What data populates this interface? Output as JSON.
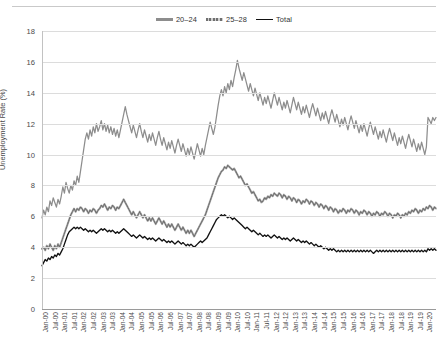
{
  "chart_data": {
    "type": "line",
    "title": "",
    "xlabel": "",
    "ylabel": "Unemployment Rate (%)",
    "ylim": [
      0,
      18
    ],
    "ytick_step": 2,
    "yticks": [
      0,
      2,
      4,
      6,
      8,
      10,
      12,
      14,
      16,
      18
    ],
    "grid": true,
    "legend_position": "top-center",
    "x_start": "Jan-00",
    "x_end": "Jan-20",
    "x_tick_interval_months": 6,
    "tick_labels": [
      "Jan-00",
      "Jul-00",
      "Jan-01",
      "Jul-01",
      "Jan-02",
      "Jul-02",
      "Jan-03",
      "Jul-03",
      "Jan-04",
      "Jul-04",
      "Jan-05",
      "Jul-05",
      "Jan-06",
      "Jul-06",
      "Jan-07",
      "Jul-07",
      "Jan-08",
      "Jul-08",
      "Jan-09",
      "Jul-09",
      "Jan-10",
      "Jul-10",
      "Jan-11",
      "Jul-11",
      "Jan-12",
      "Jul-12",
      "Jan-13",
      "Jul-13",
      "Jan-14",
      "Jul-14",
      "Jan-15",
      "Jul-15",
      "Jan-16",
      "Jul-16",
      "Jan-17",
      "Jul-17",
      "Jan-18",
      "Jul-18",
      "Jan-19",
      "Jul-19",
      "Jan-20"
    ],
    "series": [
      {
        "name": "20–24",
        "color": "#8d8d8d",
        "style": "solid-gray",
        "values": [
          5.9,
          6.4,
          6.1,
          6.6,
          6.3,
          7.0,
          6.7,
          7.2,
          6.9,
          6.6,
          7.1,
          6.8,
          7.3,
          7.9,
          7.5,
          8.2,
          7.8,
          7.5,
          8.0,
          7.7,
          8.3,
          8.0,
          8.6,
          8.2,
          8.9,
          9.6,
          10.3,
          11.0,
          11.4,
          11.0,
          11.6,
          11.2,
          11.8,
          11.4,
          12.0,
          11.5,
          11.8,
          12.2,
          11.6,
          12.0,
          11.5,
          11.9,
          11.4,
          11.8,
          11.3,
          11.7,
          11.2,
          11.6,
          11.1,
          11.6,
          12.1,
          12.6,
          13.1,
          12.6,
          12.2,
          11.8,
          11.4,
          11.9,
          11.5,
          11.1,
          11.6,
          12.0,
          11.5,
          11.1,
          11.6,
          11.2,
          10.8,
          11.3,
          10.9,
          11.4,
          11.0,
          10.6,
          11.1,
          11.5,
          11.0,
          10.6,
          11.1,
          10.7,
          10.3,
          10.8,
          10.4,
          10.9,
          10.5,
          10.1,
          10.6,
          11.0,
          10.6,
          10.2,
          10.7,
          10.3,
          9.9,
          10.4,
          10.0,
          10.5,
          10.1,
          9.7,
          10.2,
          10.7,
          10.3,
          9.9,
          10.4,
          10.0,
          10.6,
          11.1,
          11.6,
          12.1,
          11.7,
          11.3,
          11.8,
          12.5,
          13.2,
          13.8,
          14.2,
          13.8,
          14.4,
          14.0,
          14.6,
          14.2,
          14.8,
          14.4,
          15.0,
          15.5,
          16.1,
          15.6,
          15.2,
          14.8,
          15.3,
          14.9,
          14.5,
          14.1,
          14.6,
          14.2,
          13.8,
          14.3,
          13.9,
          13.5,
          14.0,
          13.6,
          13.2,
          13.7,
          13.3,
          13.8,
          13.4,
          13.0,
          13.5,
          14.0,
          13.6,
          13.2,
          13.7,
          13.3,
          12.9,
          13.4,
          13.0,
          13.5,
          13.1,
          12.7,
          13.2,
          13.7,
          13.3,
          12.9,
          13.4,
          13.0,
          12.6,
          13.1,
          12.7,
          13.2,
          12.8,
          12.4,
          12.9,
          13.3,
          12.9,
          12.5,
          13.0,
          12.6,
          12.2,
          12.7,
          12.3,
          12.8,
          12.4,
          12.0,
          12.5,
          12.9,
          12.5,
          12.1,
          12.6,
          12.2,
          11.8,
          12.3,
          11.9,
          12.4,
          12.0,
          11.6,
          12.1,
          12.5,
          12.1,
          11.7,
          12.2,
          11.8,
          11.4,
          11.9,
          11.5,
          12.0,
          11.6,
          11.2,
          11.7,
          12.1,
          11.7,
          11.3,
          11.8,
          11.4,
          11.0,
          11.5,
          11.1,
          11.6,
          11.2,
          10.8,
          11.3,
          11.7,
          11.3,
          10.9,
          11.4,
          11.0,
          10.6,
          11.1,
          10.7,
          11.2,
          10.8,
          10.4,
          10.9,
          11.3,
          10.9,
          10.5,
          11.0,
          10.6,
          10.2,
          10.7,
          10.3,
          10.8,
          10.4,
          10.0,
          10.5,
          12.4,
          12.2,
          12.0,
          12.4,
          12.2,
          12.4
        ],
        "start_value": 5.9,
        "peak_value": 16.1,
        "peak_label": "Jul-09",
        "end_value": 12.4
      },
      {
        "name": "25–28",
        "color": "#6e6e6e",
        "style": "dashed-gray",
        "values": [
          3.9,
          4.0,
          3.8,
          4.1,
          3.9,
          4.2,
          4.0,
          3.8,
          4.1,
          3.9,
          4.2,
          4.0,
          4.3,
          4.6,
          4.9,
          5.2,
          5.5,
          5.8,
          6.1,
          6.3,
          6.5,
          6.3,
          6.5,
          6.4,
          6.6,
          6.5,
          6.3,
          6.5,
          6.4,
          6.2,
          6.4,
          6.3,
          6.5,
          6.4,
          6.2,
          6.4,
          6.5,
          6.7,
          6.6,
          6.8,
          6.6,
          6.4,
          6.6,
          6.5,
          6.7,
          6.6,
          6.4,
          6.6,
          6.5,
          6.7,
          6.9,
          7.1,
          6.9,
          6.7,
          6.5,
          6.3,
          6.1,
          6.3,
          6.1,
          5.9,
          6.1,
          6.3,
          6.1,
          5.9,
          6.1,
          5.9,
          5.7,
          5.9,
          5.7,
          5.9,
          5.7,
          5.5,
          5.7,
          5.9,
          5.7,
          5.5,
          5.7,
          5.5,
          5.3,
          5.5,
          5.3,
          5.5,
          5.3,
          5.1,
          5.3,
          5.5,
          5.3,
          5.1,
          5.3,
          5.1,
          4.9,
          5.1,
          4.9,
          5.1,
          4.9,
          4.7,
          4.9,
          5.1,
          5.3,
          5.5,
          5.7,
          5.9,
          6.1,
          6.4,
          6.7,
          7.0,
          7.3,
          7.6,
          7.9,
          8.2,
          8.5,
          8.7,
          8.9,
          9.0,
          9.2,
          9.1,
          9.3,
          9.2,
          9.1,
          9.0,
          9.1,
          8.9,
          8.7,
          8.5,
          8.6,
          8.4,
          8.2,
          8.0,
          8.1,
          7.9,
          7.7,
          7.5,
          7.6,
          7.4,
          7.2,
          7.0,
          7.1,
          6.9,
          7.0,
          7.2,
          7.1,
          7.3,
          7.2,
          7.4,
          7.3,
          7.5,
          7.4,
          7.3,
          7.5,
          7.4,
          7.2,
          7.4,
          7.3,
          7.1,
          7.3,
          7.2,
          7.0,
          7.2,
          7.1,
          6.9,
          7.1,
          7.0,
          6.8,
          7.0,
          6.9,
          7.1,
          7.0,
          6.8,
          7.0,
          6.9,
          6.7,
          6.9,
          6.8,
          6.6,
          6.8,
          6.7,
          6.5,
          6.7,
          6.6,
          6.4,
          6.6,
          6.5,
          6.3,
          6.5,
          6.4,
          6.2,
          6.4,
          6.3,
          6.5,
          6.4,
          6.2,
          6.4,
          6.3,
          6.5,
          6.4,
          6.2,
          6.4,
          6.3,
          6.1,
          6.3,
          6.2,
          6.4,
          6.3,
          6.1,
          6.3,
          6.2,
          6.0,
          6.2,
          6.1,
          6.3,
          6.2,
          6.0,
          6.2,
          6.1,
          6.3,
          6.2,
          6.0,
          6.2,
          6.1,
          5.9,
          6.1,
          6.0,
          6.2,
          6.1,
          5.9,
          6.1,
          6.0,
          6.2,
          6.1,
          6.3,
          6.2,
          6.4,
          6.3,
          6.5,
          6.4,
          6.2,
          6.4,
          6.3,
          6.5,
          6.4,
          6.6,
          6.5,
          6.7,
          6.6,
          6.4,
          6.6,
          6.5
        ],
        "start_value": 3.9,
        "peak_value": 9.3,
        "peak_label": "Jan-10",
        "end_value": 6.5
      },
      {
        "name": "Total",
        "color": "#111111",
        "style": "solid-black",
        "values": [
          2.8,
          3.0,
          3.2,
          3.1,
          3.3,
          3.2,
          3.4,
          3.3,
          3.5,
          3.4,
          3.6,
          3.5,
          3.7,
          3.9,
          4.2,
          4.5,
          4.8,
          5.0,
          5.1,
          5.2,
          5.3,
          5.2,
          5.3,
          5.2,
          5.3,
          5.2,
          5.1,
          5.2,
          5.1,
          5.0,
          5.1,
          5.0,
          5.1,
          5.0,
          4.9,
          5.0,
          5.1,
          5.2,
          5.1,
          5.2,
          5.1,
          5.0,
          5.1,
          5.0,
          5.1,
          5.0,
          4.9,
          5.0,
          4.9,
          5.0,
          5.1,
          5.2,
          5.1,
          5.0,
          4.9,
          4.8,
          4.7,
          4.8,
          4.7,
          4.6,
          4.7,
          4.8,
          4.7,
          4.6,
          4.7,
          4.6,
          4.5,
          4.6,
          4.5,
          4.6,
          4.5,
          4.4,
          4.5,
          4.6,
          4.5,
          4.4,
          4.5,
          4.4,
          4.3,
          4.4,
          4.3,
          4.4,
          4.3,
          4.2,
          4.3,
          4.4,
          4.3,
          4.2,
          4.3,
          4.2,
          4.1,
          4.2,
          4.1,
          4.2,
          4.1,
          4.0,
          4.1,
          4.2,
          4.3,
          4.4,
          4.3,
          4.4,
          4.5,
          4.6,
          4.8,
          5.0,
          5.2,
          5.4,
          5.6,
          5.8,
          5.9,
          6.0,
          6.1,
          6.0,
          6.1,
          6.0,
          5.9,
          6.0,
          5.9,
          5.8,
          5.9,
          5.8,
          5.7,
          5.6,
          5.5,
          5.4,
          5.3,
          5.2,
          5.3,
          5.2,
          5.1,
          5.0,
          5.1,
          5.0,
          4.9,
          4.8,
          4.9,
          4.8,
          4.7,
          4.8,
          4.7,
          4.8,
          4.7,
          4.6,
          4.7,
          4.8,
          4.7,
          4.6,
          4.7,
          4.6,
          4.5,
          4.6,
          4.5,
          4.6,
          4.5,
          4.4,
          4.5,
          4.6,
          4.5,
          4.4,
          4.5,
          4.4,
          4.3,
          4.4,
          4.3,
          4.4,
          4.3,
          4.2,
          4.3,
          4.2,
          4.1,
          4.2,
          4.1,
          4.0,
          4.1,
          4.0,
          3.9,
          4.0,
          3.9,
          3.8,
          3.9,
          3.8,
          3.9,
          3.8,
          3.7,
          3.8,
          3.7,
          3.8,
          3.7,
          3.8,
          3.7,
          3.8,
          3.7,
          3.8,
          3.7,
          3.8,
          3.7,
          3.8,
          3.7,
          3.8,
          3.7,
          3.8,
          3.7,
          3.8,
          3.7,
          3.8,
          3.7,
          3.6,
          3.7,
          3.8,
          3.7,
          3.8,
          3.7,
          3.8,
          3.7,
          3.8,
          3.7,
          3.8,
          3.7,
          3.8,
          3.7,
          3.8,
          3.7,
          3.8,
          3.7,
          3.8,
          3.7,
          3.8,
          3.7,
          3.8,
          3.7,
          3.8,
          3.7,
          3.8,
          3.7,
          3.8,
          3.7,
          3.8,
          3.7,
          3.8,
          3.7,
          3.9,
          3.8,
          3.9,
          3.8,
          3.9,
          3.8
        ],
        "start_value": 2.8,
        "peak_value": 6.1,
        "peak_label": "Jan-09",
        "end_value": 3.8
      }
    ]
  },
  "legend": {
    "items": [
      {
        "label": "20–24"
      },
      {
        "label": "25–28"
      },
      {
        "label": "Total"
      }
    ]
  },
  "axes": {
    "y_title": "Unemployment Rate (%)"
  }
}
